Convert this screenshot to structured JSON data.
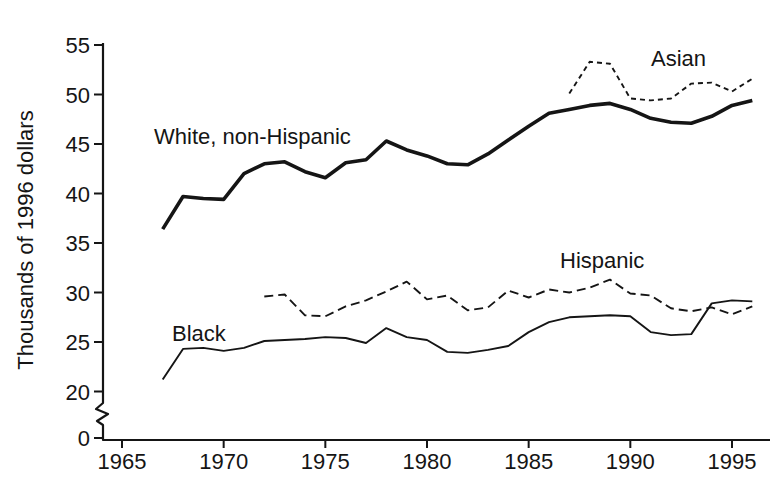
{
  "figure": {
    "background": "#ffffff",
    "ink_color": "#151515"
  },
  "chart_data": {
    "type": "line",
    "title": "",
    "xlabel": "",
    "ylabel": "Thousands of 1996 dollars",
    "grid": false,
    "legend_position": "inline-labels-next-to-lines",
    "xlim": [
      1965,
      1996
    ],
    "ylim": [
      0,
      55
    ],
    "y_axis_break_between": [
      0,
      20
    ],
    "x_ticks": [
      1965,
      1970,
      1975,
      1980,
      1985,
      1990,
      1995
    ],
    "x_tick_labels": [
      "1965",
      "1970",
      "1975",
      "1980",
      "1985",
      "1990",
      "1995"
    ],
    "y_ticks": [
      55,
      50,
      45,
      40,
      35,
      30,
      25,
      20,
      0
    ],
    "y_tick_labels": [
      "55",
      "50",
      "45",
      "40",
      "35",
      "30",
      "25",
      "20",
      "0"
    ],
    "series": [
      {
        "name": "White, non-Hispanic",
        "line_style": "solid-thick",
        "x": [
          1967,
          1968,
          1969,
          1970,
          1971,
          1972,
          1973,
          1974,
          1975,
          1976,
          1977,
          1978,
          1979,
          1980,
          1981,
          1982,
          1983,
          1984,
          1985,
          1986,
          1987,
          1988,
          1989,
          1990,
          1991,
          1992,
          1993,
          1994,
          1995,
          1996
        ],
        "values": [
          36.4,
          39.7,
          39.5,
          39.4,
          42.0,
          43.0,
          43.2,
          42.2,
          41.6,
          43.1,
          43.4,
          45.3,
          44.4,
          43.8,
          43.0,
          42.9,
          44.0,
          45.4,
          46.8,
          48.1,
          48.5,
          48.9,
          49.1,
          48.5,
          47.6,
          47.2,
          47.1,
          47.8,
          48.9,
          49.4
        ]
      },
      {
        "name": "Asian",
        "line_style": "dashed-short",
        "x": [
          1987,
          1988,
          1989,
          1990,
          1991,
          1992,
          1993,
          1994,
          1995,
          1996
        ],
        "values": [
          50.1,
          53.3,
          53.1,
          49.6,
          49.4,
          49.6,
          51.1,
          51.2,
          50.3,
          51.6
        ]
      },
      {
        "name": "Hispanic",
        "line_style": "dashed-long",
        "x": [
          1972,
          1973,
          1974,
          1975,
          1976,
          1977,
          1978,
          1979,
          1980,
          1981,
          1982,
          1983,
          1984,
          1985,
          1986,
          1987,
          1988,
          1989,
          1990,
          1991,
          1992,
          1993,
          1994,
          1995,
          1996
        ],
        "values": [
          29.6,
          29.8,
          27.7,
          27.6,
          28.6,
          29.2,
          30.1,
          31.1,
          29.3,
          29.7,
          28.2,
          28.5,
          30.2,
          29.5,
          30.3,
          30.0,
          30.5,
          31.3,
          29.9,
          29.7,
          28.4,
          28.1,
          28.5,
          27.8,
          28.6
        ]
      },
      {
        "name": "Black",
        "line_style": "solid-thin",
        "x": [
          1967,
          1968,
          1969,
          1970,
          1971,
          1972,
          1973,
          1974,
          1975,
          1976,
          1977,
          1978,
          1979,
          1980,
          1981,
          1982,
          1983,
          1984,
          1985,
          1986,
          1987,
          1988,
          1989,
          1990,
          1991,
          1992,
          1993,
          1994,
          1995,
          1996
        ],
        "values": [
          21.2,
          24.3,
          24.4,
          24.1,
          24.4,
          25.1,
          25.2,
          25.3,
          25.5,
          25.4,
          24.9,
          26.4,
          25.5,
          25.2,
          24.0,
          23.9,
          24.2,
          24.6,
          26.0,
          27.0,
          27.5,
          27.6,
          27.7,
          27.6,
          26.0,
          25.7,
          25.8,
          28.9,
          29.2,
          29.1
        ]
      }
    ]
  }
}
